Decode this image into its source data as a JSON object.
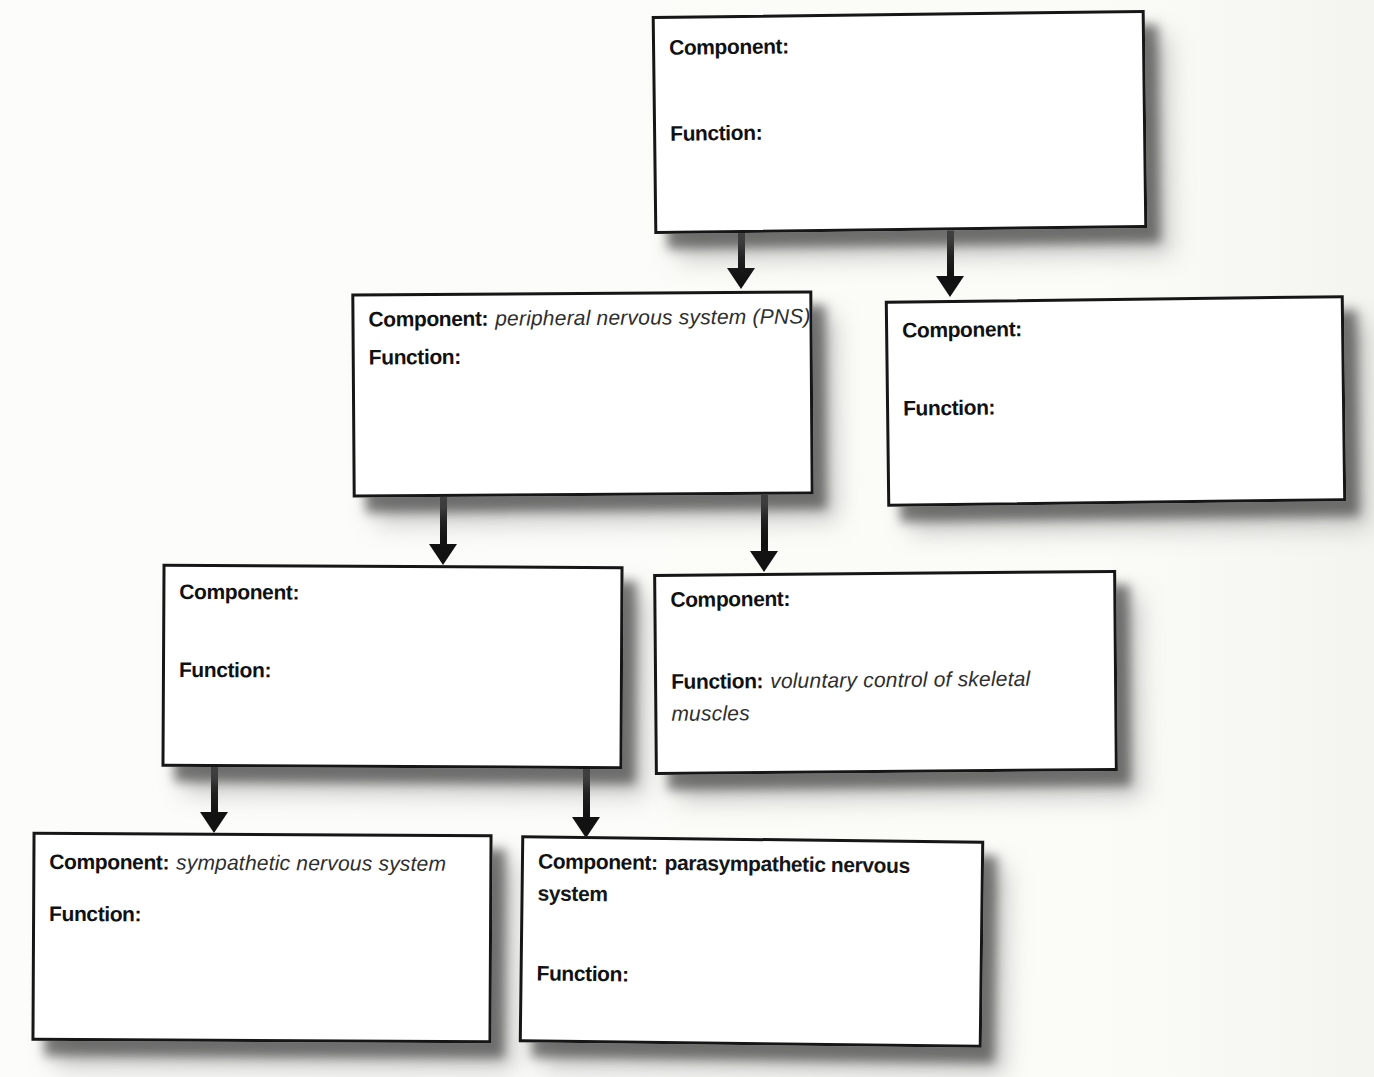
{
  "diagram": {
    "type": "concept-map",
    "boxes": [
      {
        "component_label": "Component:",
        "component_value": "",
        "function_label": "Function:",
        "function_value": ""
      },
      {
        "component_label": "Component:",
        "component_value": "peripheral nervous system (PNS)",
        "function_label": "Function:",
        "function_value": ""
      },
      {
        "component_label": "Component:",
        "component_value": "",
        "function_label": "Function:",
        "function_value": ""
      },
      {
        "component_label": "Component:",
        "component_value": "",
        "function_label": "Function:",
        "function_value": ""
      },
      {
        "component_label": "Component:",
        "component_value": "",
        "function_label": "Function:",
        "function_value": "voluntary control of skeletal muscles"
      },
      {
        "component_label": "Component:",
        "component_value": "sympathetic nervous system",
        "function_label": "Function:",
        "function_value": ""
      },
      {
        "component_label": "Component:",
        "component_value": "parasympathetic nervous system",
        "function_label": "Function:",
        "function_value": ""
      }
    ],
    "colors": {
      "box_border": "#161616",
      "box_background": "#ffffff",
      "arrow": "#121212",
      "shadow": "#6a6a6a",
      "label_text": "#111111",
      "answer_text": "#2e2e2e",
      "page_background": "#fbfbf8"
    }
  }
}
